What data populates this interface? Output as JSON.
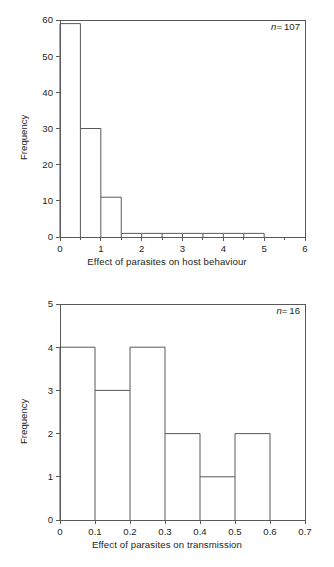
{
  "figure": {
    "background": "#ffffff",
    "line_color": "#58595b",
    "text_color": "#231f20"
  },
  "panels": [
    {
      "id": "top",
      "annotation_prefix": "n",
      "annotation_equals": "=",
      "annotation_value": "107",
      "ylabel": "Frequency",
      "xlabel": "Effect of parasites on host behaviour",
      "chart_data": {
        "type": "bar",
        "title": "",
        "xlabel": "Effect of parasites on host behaviour",
        "ylabel": "Frequency",
        "xlim": [
          0,
          6
        ],
        "ylim": [
          0,
          60
        ],
        "xticks": [
          "0",
          "1",
          "2",
          "3",
          "4",
          "5",
          "6"
        ],
        "xtick_values": [
          0,
          1,
          2,
          3,
          4,
          5,
          6
        ],
        "xminor_step": 0.5,
        "yticks": [
          "0",
          "10",
          "20",
          "30",
          "40",
          "50",
          "60"
        ],
        "ytick_values": [
          0,
          10,
          20,
          30,
          40,
          50,
          60
        ],
        "bin_width": 0.5,
        "bin_edges": [
          0,
          0.5,
          1.0,
          1.5,
          2.0,
          2.5,
          3.0,
          3.5,
          4.0,
          4.5,
          5.0
        ],
        "categories": [
          "0-0.5",
          "0.5-1.0",
          "1.0-1.5",
          "1.5-2.0",
          "2.0-2.5",
          "2.5-3.0",
          "3.0-3.5",
          "3.5-4.0",
          "4.0-4.5",
          "4.5-5.0"
        ],
        "values": [
          59,
          30,
          11,
          1,
          1,
          1,
          1,
          1,
          1,
          1
        ],
        "grid": false,
        "legend": "none",
        "annotations": [
          "n = 107"
        ]
      }
    },
    {
      "id": "bottom",
      "annotation_prefix": "n",
      "annotation_equals": "=",
      "annotation_value": "16",
      "ylabel": "Frequency",
      "xlabel": "Effect of parasites on transmission",
      "chart_data": {
        "type": "bar",
        "title": "",
        "xlabel": "Effect of parasites on transmission",
        "ylabel": "Frequency",
        "xlim": [
          0,
          0.7
        ],
        "ylim": [
          0,
          5
        ],
        "xticks": [
          "0",
          "0.1",
          "0.2",
          "0.3",
          "0.4",
          "0.5",
          "0.6",
          "0.7"
        ],
        "xtick_values": [
          0,
          0.1,
          0.2,
          0.3,
          0.4,
          0.5,
          0.6,
          0.7
        ],
        "xminor_step": 0,
        "yticks": [
          "0",
          "1",
          "2",
          "3",
          "4",
          "5"
        ],
        "ytick_values": [
          0,
          1,
          2,
          3,
          4,
          5
        ],
        "bin_width": 0.1,
        "bin_edges": [
          0,
          0.1,
          0.2,
          0.3,
          0.4,
          0.5,
          0.6
        ],
        "categories": [
          "0-0.1",
          "0.1-0.2",
          "0.2-0.3",
          "0.3-0.4",
          "0.4-0.5",
          "0.5-0.6"
        ],
        "values": [
          4,
          3,
          4,
          2,
          1,
          2
        ],
        "grid": false,
        "legend": "none",
        "annotations": [
          "n = 16"
        ]
      }
    }
  ]
}
